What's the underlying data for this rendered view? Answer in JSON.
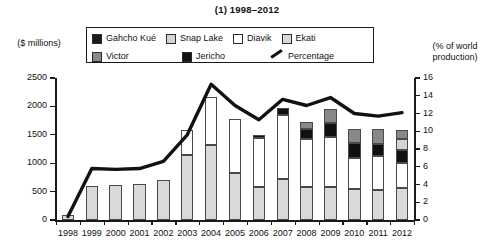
{
  "title": "(1) 1998–2012",
  "axis": {
    "left_caption": "($ millions)",
    "right_caption": "(% of world production)",
    "left_ticks": [
      "0",
      "500",
      "1000",
      "1500",
      "2000",
      "2500"
    ],
    "right_ticks": [
      "0",
      "2",
      "4",
      "6",
      "8",
      "10",
      "12",
      "14",
      "16"
    ]
  },
  "legend": {
    "row1": [
      {
        "label": "Gahcho Kué",
        "color": "#1a1a1a",
        "type": "swatch"
      },
      {
        "label": "Snap Lake",
        "color": "#d4d4d4",
        "type": "swatch"
      },
      {
        "label": "Diavik",
        "color": "#ffffff",
        "type": "swatch"
      },
      {
        "label": "Ekati",
        "color": "#d9d9d9",
        "type": "swatch"
      }
    ],
    "row2": [
      {
        "label": "Victor",
        "color": "#888888",
        "type": "swatch"
      },
      {
        "label": "Jericho",
        "color": "#111111",
        "type": "swatch"
      },
      {
        "label": "Percentage",
        "color": "#111111",
        "type": "line"
      }
    ]
  },
  "colors": {
    "gahcho_kue": "#1a1a1a",
    "snap_lake": "#d4d4d4",
    "diavik": "#ffffff",
    "ekati": "#d9d9d9",
    "victor": "#888888",
    "jericho": "#111111",
    "percentage_line": "#111111",
    "axis": "#1a1a1a"
  },
  "chart_data": {
    "type": "bar",
    "title": "(1) 1998–2012",
    "xlabel": "",
    "ylabel": "($ millions)",
    "y2label": "(% of world production)",
    "ylim": [
      0,
      2500
    ],
    "y2lim": [
      0,
      16
    ],
    "grid": false,
    "legend_position": "top-center",
    "categories": [
      "1998",
      "1999",
      "2000",
      "2001",
      "2002",
      "2003",
      "2004",
      "2005",
      "2006",
      "2007",
      "2008",
      "2009",
      "2010",
      "2011",
      "2012"
    ],
    "series": [
      {
        "name": "Ekati",
        "color": "#d9d9d9",
        "values": [
          80,
          600,
          620,
          640,
          700,
          1140,
          1320,
          820,
          580,
          720,
          580,
          590,
          540,
          530,
          560
        ]
      },
      {
        "name": "Diavik",
        "color": "#ffffff",
        "values": [
          0,
          0,
          0,
          0,
          0,
          450,
          840,
          950,
          860,
          1130,
          850,
          870,
          560,
          600,
          440
        ]
      },
      {
        "name": "Jericho",
        "color": "#111111",
        "values": [
          0,
          0,
          0,
          0,
          0,
          0,
          0,
          0,
          60,
          130,
          170,
          240,
          260,
          200,
          230
        ]
      },
      {
        "name": "Snap Lake",
        "color": "#d4d4d4",
        "values": [
          0,
          0,
          0,
          0,
          0,
          0,
          0,
          0,
          0,
          0,
          0,
          0,
          0,
          0,
          200
        ]
      },
      {
        "name": "Victor",
        "color": "#888888",
        "values": [
          0,
          0,
          0,
          0,
          0,
          0,
          0,
          0,
          0,
          0,
          130,
          250,
          250,
          270,
          160
        ]
      }
    ],
    "line_series": {
      "name": "Percentage",
      "color": "#111111",
      "axis": "right",
      "values": [
        0.4,
        5.8,
        5.7,
        5.8,
        6.6,
        9.6,
        15.3,
        12.9,
        11.3,
        13.6,
        12.9,
        13.8,
        12.0,
        11.7,
        12.1
      ]
    }
  }
}
